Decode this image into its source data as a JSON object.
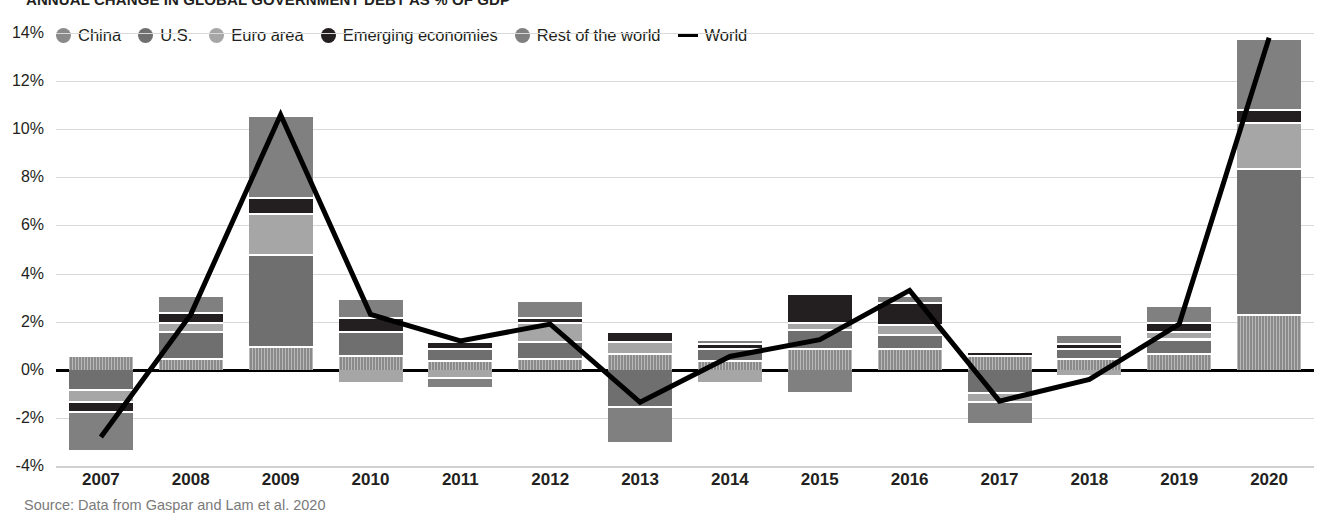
{
  "title": "ANNUAL CHANGE IN GLOBAL GOVERNMENT DEBT AS % OF GDP",
  "source": "Source: Data from Gaspar and Lam et al. 2020",
  "legend": {
    "items": [
      {
        "label": "China",
        "marker": "dot",
        "color": "#8a8a8a",
        "key": "china"
      },
      {
        "label": "U.S.",
        "marker": "dot",
        "color": "#6f6f6f",
        "key": "us"
      },
      {
        "label": "Euro area",
        "marker": "dot",
        "color": "#a6a6a6",
        "key": "euro"
      },
      {
        "label": "Emerging economies",
        "marker": "dot",
        "color": "#231f20",
        "key": "emerging"
      },
      {
        "label": "Rest of the world",
        "marker": "dot",
        "color": "#808080",
        "key": "row"
      },
      {
        "label": "World",
        "marker": "line",
        "color": "#000000",
        "key": "world"
      }
    ]
  },
  "chart_data": {
    "type": "bar",
    "subtype": "stacked-bar-with-line",
    "title": "ANNUAL CHANGE IN GLOBAL GOVERNMENT DEBT AS % OF GDP",
    "xlabel": "",
    "ylabel": "",
    "ylim": [
      -4,
      14
    ],
    "ytick_step": 2,
    "ytick_labels": [
      "14%",
      "12%",
      "10%",
      "8%",
      "6%",
      "4%",
      "2%",
      "0%",
      "-2%",
      "-4%"
    ],
    "ytick_values": [
      14,
      12,
      10,
      8,
      6,
      4,
      2,
      0,
      -2,
      -4
    ],
    "grid": true,
    "legend_position": "top",
    "categories": [
      "2007",
      "2008",
      "2009",
      "2010",
      "2011",
      "2012",
      "2013",
      "2014",
      "2015",
      "2016",
      "2017",
      "2018",
      "2019",
      "2020"
    ],
    "series": [
      {
        "name": "China",
        "key": "china",
        "color": "#8a8a8a",
        "values": [
          0.6,
          0.5,
          1.0,
          0.6,
          0.4,
          0.5,
          0.7,
          0.4,
          0.9,
          0.9,
          0.6,
          0.5,
          0.7,
          2.3
        ]
      },
      {
        "name": "U.S.",
        "key": "us",
        "color": "#6f6f6f",
        "values": [
          -0.9,
          1.1,
          3.8,
          1.0,
          0.5,
          0.7,
          -1.6,
          0.5,
          0.8,
          0.6,
          -1.0,
          0.4,
          0.6,
          6.1
        ]
      },
      {
        "name": "Euro area",
        "key": "euro",
        "color": "#a6a6a6",
        "values": [
          -0.5,
          0.4,
          1.7,
          -0.6,
          -0.4,
          0.8,
          0.5,
          -0.6,
          0.3,
          0.4,
          -0.4,
          -0.3,
          0.3,
          1.9
        ]
      },
      {
        "name": "Emerging economies",
        "key": "emerging",
        "color": "#231f20",
        "values": [
          -0.4,
          0.4,
          0.7,
          0.6,
          0.3,
          0.2,
          0.4,
          0.2,
          1.2,
          0.9,
          0.2,
          0.2,
          0.4,
          0.55
        ]
      },
      {
        "name": "Rest of the world",
        "key": "row",
        "color": "#808080",
        "values": [
          -1.6,
          0.7,
          3.4,
          0.8,
          -0.4,
          0.7,
          -1.5,
          0.2,
          -1.0,
          0.3,
          -0.9,
          0.4,
          0.7,
          2.95
        ]
      }
    ],
    "line_series": {
      "name": "World",
      "color": "#000000",
      "values": [
        -2.8,
        2.3,
        10.6,
        2.3,
        1.2,
        1.9,
        -1.35,
        0.55,
        1.25,
        3.3,
        -1.3,
        -0.4,
        1.9,
        13.8
      ]
    }
  }
}
